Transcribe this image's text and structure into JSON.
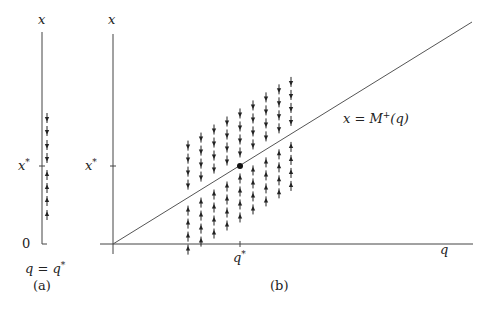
{
  "panel_a": {
    "y_axis_label": "x",
    "x_star_label": "x*",
    "x_star_label_base": "x",
    "x_star_label_sup": "*",
    "zero_label": "0",
    "caption_eq": "q = q*",
    "caption_eq_base": "q = q",
    "caption_eq_sup": "*",
    "panel_label": "(a)",
    "axis_x": 42,
    "axis_top": 30,
    "axis_bottom": 244,
    "x_star_y": 166,
    "arrows": {
      "x": 47,
      "down_ys": [
        118,
        131,
        145,
        158
      ],
      "up_ys": [
        175,
        188,
        201,
        215
      ]
    }
  },
  "panel_b": {
    "y_axis_label": "x",
    "x_axis_label": "q",
    "x_star_label": "x*",
    "x_star_label_base": "x",
    "x_star_label_sup": "*",
    "q_star_label": "q*",
    "q_star_label_base": "q",
    "q_star_label_sup": "*",
    "curve_label": "x = M+(q)",
    "curve_label_pre": "x = M",
    "curve_label_sup": "+",
    "curve_label_post": "(q)",
    "panel_label": "(b)",
    "origin": [
      113,
      244
    ],
    "curve_end": [
      472,
      22
    ],
    "equilibrium_point": [
      240,
      166
    ],
    "columns_x": [
      188,
      201,
      214,
      227,
      240,
      253,
      266,
      279,
      291
    ],
    "row_spacing": 13,
    "arrows_per_side": 4
  },
  "chart_data": {
    "type": "diagram",
    "title": "",
    "panels": [
      {
        "id": "a",
        "label": "(a)",
        "description": "Vertical phase line at q = q*",
        "axis_label": "x",
        "ticks": [
          "0",
          "x*"
        ],
        "arrows_above_x_star": "down",
        "arrows_below_x_star": "up",
        "arrow_count": 8
      },
      {
        "id": "b",
        "label": "(b)",
        "description": "Phase plane with line x = M+(q) through origin; vertical flow arrows toward the line",
        "xlabel": "q",
        "ylabel": "x",
        "ticks_x": [
          "q*"
        ],
        "ticks_y": [
          "x*"
        ],
        "curve": "x = M+(q)",
        "equilibrium": [
          "q*",
          "x*"
        ],
        "arrows_above_curve": "down",
        "arrows_below_curve": "up",
        "columns": 9,
        "arrows_per_column": 8
      }
    ]
  }
}
